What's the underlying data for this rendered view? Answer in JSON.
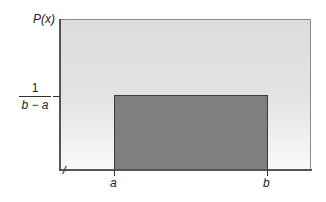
{
  "chart_data": {
    "type": "area",
    "title": "",
    "ylabel": "P(x)",
    "xlabel": "",
    "x_tick_labels": [
      "a",
      "b"
    ],
    "y_tick_labels": [
      "1/(b − a)"
    ],
    "series": [
      {
        "name": "P(x)",
        "x": [
          "a",
          "a",
          "b",
          "b"
        ],
        "values": [
          "0",
          "1/(b − a)",
          "1/(b − a)",
          "0"
        ]
      }
    ],
    "axis_break": "x-axis break marker near origin",
    "grid": false,
    "legend": "none"
  },
  "labels": {
    "y_axis": "P(x)",
    "y_tick_numerator": "1",
    "y_tick_denominator": "b − a",
    "x_tick_a": "a",
    "x_tick_b": "b",
    "axis_break": "//"
  }
}
